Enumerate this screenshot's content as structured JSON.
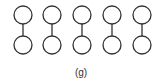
{
  "caption": "(g)",
  "diagram": {
    "node_radius": 9,
    "stroke_color": "#333333",
    "pairs": [
      {
        "x": 23,
        "top_y": 15,
        "bottom_y": 45
      },
      {
        "x": 52,
        "top_y": 15,
        "bottom_y": 45
      },
      {
        "x": 82,
        "top_y": 15,
        "bottom_y": 45
      },
      {
        "x": 112,
        "top_y": 15,
        "bottom_y": 45
      },
      {
        "x": 142,
        "top_y": 15,
        "bottom_y": 45
      }
    ]
  }
}
